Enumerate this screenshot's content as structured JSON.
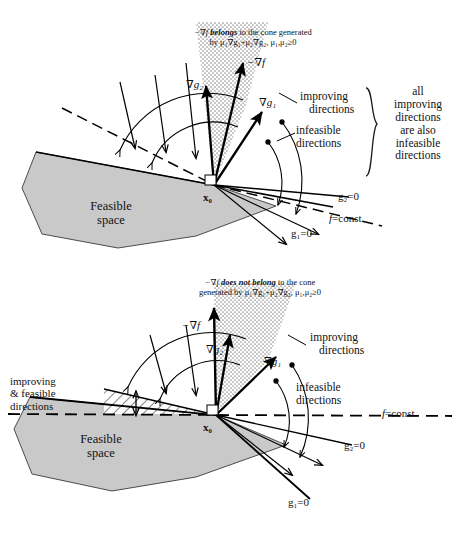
{
  "figure": {
    "type": "diagram",
    "topic": "Karush-Kuhn-Tucker cone condition illustration",
    "fills": {
      "feasible_gray": "#c9c9c9",
      "cone_stipple": "#9a9a9a",
      "hatch_line": "#333333",
      "stroke": "#000000",
      "page_bg": "#ffffff"
    }
  },
  "panels": [
    {
      "id": "top",
      "caption_line1_pre": "−∇f ",
      "caption_line1_bold": "belongs",
      "caption_line1_post": " to the cone generated",
      "caption_line2": "by μ₁∇g₁+μ₂∇g₂, μ₁,μ₂≥0",
      "vectors": [
        {
          "name": "-grad-f",
          "label": "−∇f"
        },
        {
          "name": "grad-g2",
          "label": "∇g₂"
        },
        {
          "name": "grad-g1",
          "label": "∇g₁"
        }
      ],
      "point_label": "x₀",
      "region_label_line1": "Feasible",
      "region_label_line2": "space",
      "improving_label_line1": "improving",
      "improving_label_line2": "directions",
      "infeasible_label_line1": "infeasible",
      "infeasible_label_line2": "directions",
      "bracket_note": "all improving directions are also infeasible directions",
      "bracket_note_lines": [
        "all",
        "improving",
        "directions",
        "are also",
        "infeasible",
        "directions"
      ],
      "line_labels": [
        {
          "name": "g2-line",
          "label": "g₂=0"
        },
        {
          "name": "g1-line",
          "label": "g₁=0"
        },
        {
          "name": "f-const-line",
          "label_italic": "f",
          "label_rest": "=const."
        }
      ]
    },
    {
      "id": "bottom",
      "caption_line1_pre": "−∇f ",
      "caption_line1_bold": "does not belong",
      "caption_line1_post": " to the cone",
      "caption_line2": "generated by μ₁∇g₁+μ₂∇g₂, μ₁,μ₂≥0",
      "vectors": [
        {
          "name": "-grad-f",
          "label": "−∇f"
        },
        {
          "name": "grad-g2",
          "label": "∇g₂"
        },
        {
          "name": "grad-g1",
          "label": "∇g₁"
        }
      ],
      "point_label": "x₀",
      "region_label_line1": "Feasible",
      "region_label_line2": "space",
      "improving_label_line1": "improving",
      "improving_label_line2": "directions",
      "infeasible_label_line1": "infeasible",
      "infeasible_label_line2": "directions",
      "improving_feasible_lines": [
        "improving",
        "& feasible",
        "directions"
      ],
      "line_labels": [
        {
          "name": "g2-line",
          "label": "g₂=0"
        },
        {
          "name": "g1-line",
          "label": "g₁=0"
        },
        {
          "name": "f-const-line",
          "label_italic": "f",
          "label_rest": "=const."
        }
      ]
    }
  ]
}
